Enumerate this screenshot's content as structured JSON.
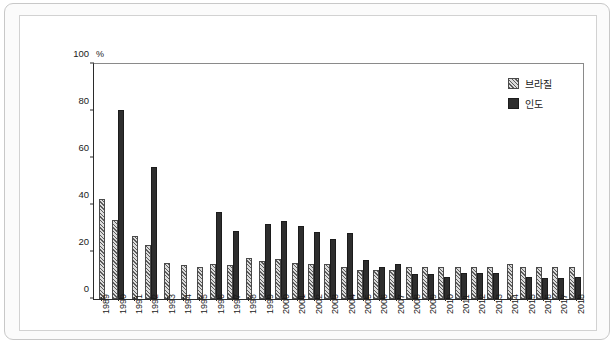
{
  "chart_data": {
    "type": "bar",
    "title": "",
    "xlabel": "",
    "ylabel": "%",
    "unit_label": "%",
    "ylim": [
      0,
      100
    ],
    "yticks": [
      0,
      20,
      40,
      60,
      80,
      100
    ],
    "grid": false,
    "legend_position": "top-right",
    "categories": [
      "1989",
      "1990",
      "1991",
      "1992",
      "1993",
      "1994",
      "1995",
      "1996",
      "1997",
      "1998",
      "1999",
      "2000",
      "2001",
      "2002",
      "2003",
      "2004",
      "2005",
      "2006",
      "2007",
      "2008",
      "2009",
      "2010",
      "2011",
      "2012",
      "2013",
      "2014",
      "2015",
      "2016",
      "2017",
      "2018"
    ],
    "series": [
      {
        "name": "브라질",
        "color": "#9a9a9a",
        "pattern": "diagonal-hatch",
        "values": [
          42.5,
          33.5,
          27.0,
          23.0,
          15.5,
          14.5,
          13.5,
          15.0,
          14.5,
          17.5,
          16.0,
          17.0,
          15.5,
          15.0,
          15.0,
          13.5,
          12.5,
          12.5,
          12.5,
          13.5,
          13.5,
          13.5,
          13.5,
          13.5,
          13.5,
          15.0,
          13.5,
          13.5,
          13.5,
          13.5
        ]
      },
      {
        "name": "인도",
        "color": "#2e2e2e",
        "pattern": "solid",
        "values": [
          null,
          80.5,
          null,
          56.0,
          null,
          null,
          null,
          37.0,
          29.0,
          null,
          32.0,
          33.0,
          31.0,
          28.5,
          25.5,
          28.0,
          16.5,
          13.5,
          15.0,
          10.5,
          10.5,
          9.5,
          11.0,
          11.0,
          11.0,
          null,
          9.5,
          9.0,
          9.0,
          9.5
        ]
      }
    ]
  },
  "legend": {
    "items": [
      {
        "label": "브라질"
      },
      {
        "label": "인도"
      }
    ]
  }
}
